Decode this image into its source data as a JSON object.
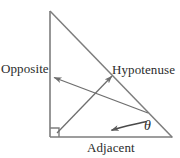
{
  "figure": {
    "name": "right-triangle-trigonometry-diagram",
    "background_color": "#ffffff",
    "stroke_color": "#7d7d7d",
    "text_color": "#2b2b2b",
    "width": 180,
    "height": 158
  },
  "labels": {
    "opposite": "Opposite",
    "hypotenuse": "Hypotenuse",
    "adjacent": "Adjacent",
    "theta": "θ"
  },
  "geometry": {
    "apex": [
      50,
      11
    ],
    "right_angle_vertex": [
      50,
      137
    ],
    "theta_vertex": [
      172,
      137
    ],
    "right_angle_marker_size": 9,
    "opposite_side": "vertical leg from (50,11) to (50,137)",
    "adjacent_side": "horizontal leg from (50,137) to (172,137)",
    "hypotenuse_side": "slanted side from (50,11) to (172,137)"
  },
  "annotations": {
    "opposite_arrow": {
      "from": [
        148,
        113
      ],
      "to": [
        52,
        77
      ],
      "points_to": "opposite-side"
    },
    "hypotenuse_arrow": {
      "from": [
        57,
        133
      ],
      "to": [
        113,
        75
      ],
      "points_to": "hypotenuse-side"
    },
    "theta_arrow": {
      "from": [
        146,
        122
      ],
      "to": [
        108,
        130
      ],
      "points_to": "theta-angle",
      "style": "curved"
    }
  }
}
